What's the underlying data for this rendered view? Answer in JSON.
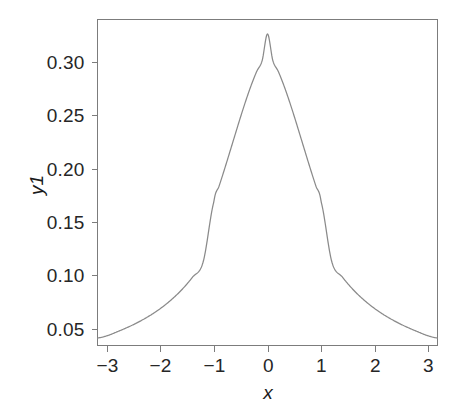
{
  "figure": {
    "background_color": "#ffffff",
    "frame_color": "#7c7c7c",
    "text_color": "#262626"
  },
  "chart_data": {
    "type": "line",
    "title": "",
    "subtitle": "",
    "xlabel": "x",
    "ylabel": "y1",
    "xlim": [
      -3.17,
      3.17
    ],
    "ylim": [
      0.0345,
      0.3395
    ],
    "grid": false,
    "legend": false,
    "legend_position": "none",
    "line_color": "#8a8a8a",
    "line_width": 1.25,
    "xticks": [
      -3,
      -2,
      -1,
      0,
      1,
      2,
      3
    ],
    "xtick_labels": [
      "−3",
      "−2",
      "−1",
      "0",
      "1",
      "2",
      "3"
    ],
    "yticks": [
      0.05,
      0.1,
      0.15,
      0.2,
      0.25,
      0.3
    ],
    "ytick_labels": [
      "0.05",
      "0.10",
      "0.15",
      "0.20",
      "0.25",
      "0.30"
    ],
    "series": [
      {
        "name": "y1",
        "x": [
          -3.17,
          -3.0,
          -2.8,
          -2.6,
          -2.4,
          -2.2,
          -2.0,
          -1.8,
          -1.6,
          -1.4,
          -1.2,
          -1.0,
          -0.9,
          -0.8,
          -0.7,
          -0.6,
          -0.5,
          -0.4,
          -0.3,
          -0.2,
          -0.1,
          0.0,
          0.1,
          0.2,
          0.3,
          0.4,
          0.5,
          0.6,
          0.7,
          0.8,
          0.9,
          1.0,
          1.2,
          1.4,
          1.6,
          1.8,
          2.0,
          2.2,
          2.4,
          2.6,
          2.8,
          3.0,
          3.17
        ],
        "y": [
          0.0415,
          0.0435,
          0.0474,
          0.0517,
          0.0566,
          0.0623,
          0.069,
          0.077,
          0.0866,
          0.0983,
          0.1127,
          0.169,
          0.184,
          0.1997,
          0.216,
          0.2324,
          0.2487,
          0.2642,
          0.2785,
          0.291,
          0.301,
          0.326,
          0.301,
          0.291,
          0.2785,
          0.2642,
          0.2487,
          0.2324,
          0.216,
          0.1997,
          0.184,
          0.169,
          0.1127,
          0.0983,
          0.0866,
          0.077,
          0.069,
          0.0623,
          0.0566,
          0.0517,
          0.0474,
          0.0435,
          0.0415
        ]
      }
    ],
    "peak": {
      "x": 0.0,
      "y": 0.326
    }
  },
  "axes": {
    "x_title": "x",
    "y_title": "y1"
  }
}
